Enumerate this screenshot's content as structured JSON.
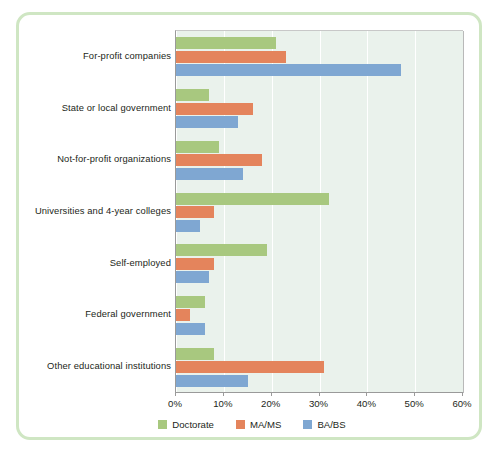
{
  "chart_data": {
    "type": "bar",
    "orientation": "horizontal",
    "title": "",
    "subtitle": "",
    "xlabel": "",
    "ylabel": "",
    "xlim": [
      0,
      60
    ],
    "xunit": "%",
    "xticks": [
      "0%",
      "10%",
      "20%",
      "30%",
      "40%",
      "50%",
      "60%"
    ],
    "xtick_values": [
      0,
      10,
      20,
      30,
      40,
      50,
      60
    ],
    "grid": true,
    "legend_position": "bottom",
    "categories": [
      "For-profit companies",
      "State or local government",
      "Not-for-profit organizations",
      "Universities and 4-year colleges",
      "Self-employed",
      "Federal government",
      "Other educational institutions"
    ],
    "series": [
      {
        "name": "Doctorate",
        "color": "#a8c87f",
        "values": [
          21,
          7,
          9,
          32,
          19,
          6,
          8
        ]
      },
      {
        "name": "MA/MS",
        "color": "#e4845c",
        "values": [
          23,
          16,
          18,
          8,
          8,
          3,
          31
        ]
      },
      {
        "name": "BA/BS",
        "color": "#7fa7d2",
        "values": [
          47,
          13,
          14,
          5,
          7,
          6,
          15
        ]
      }
    ]
  },
  "legend": {
    "items": [
      {
        "label": "Doctorate",
        "color": "#a8c87f"
      },
      {
        "label": "MA/MS",
        "color": "#e4845c"
      },
      {
        "label": "BA/BS",
        "color": "#7fa7d2"
      }
    ]
  },
  "frame": {
    "border_color": "#cfe6c3",
    "plot_background": "#eaf2ec"
  }
}
